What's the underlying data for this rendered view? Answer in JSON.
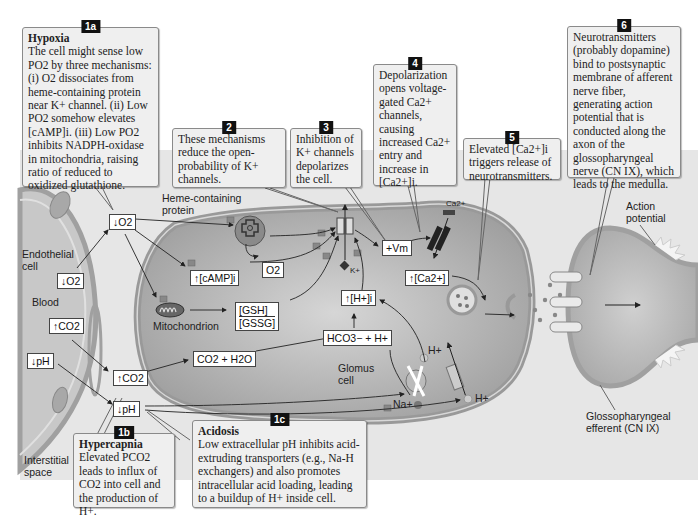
{
  "callouts": {
    "c1a": {
      "badge": "1a",
      "title": "Hypoxia",
      "text": "The cell might sense low PO2 by three mechanisms: (i) O2 dissociates from heme-containing protein near K+ channel. (ii) Low PO2 somehow elevates [cAMP]i. (iii) Low PO2 inhibits NADPH-oxidase in mitochondria, raising ratio of reduced to oxidized glutathione."
    },
    "c2": {
      "badge": "2",
      "text": "These mechanisms reduce the open-probability of K+ channels."
    },
    "c3": {
      "badge": "3",
      "text": "Inhibition of K+ channels depolarizes the cell."
    },
    "c4": {
      "badge": "4",
      "text": "Depolarization opens voltage-gated Ca2+ channels, causing increased Ca2+ entry and increase in [Ca2+]i."
    },
    "c5": {
      "badge": "5",
      "text": "Elevated [Ca2+]i triggers release of neurotransmitters."
    },
    "c6": {
      "badge": "6",
      "text": "Neurotransmitters (probably dopamine) bind to postsynaptic membrane of afferent nerve fiber, generating action potential that is conducted along the axon of the glossopharyngeal nerve (CN IX), which leads to the medulla."
    },
    "c1b": {
      "badge": "1b",
      "title": "Hypercapnia",
      "text": "Elevated PCO2 leads to influx of CO2 into cell and the production of H+."
    },
    "c1c": {
      "badge": "1c",
      "title": "Acidosis",
      "text": "Low extracellular pH inhibits acid-extruding transporters (e.g., Na-H exchangers) and also promotes intracellular acid loading, leading to a buildup of H+ inside cell."
    }
  },
  "labels": {
    "endothelial_cell": "Endothelial cell",
    "blood": "Blood",
    "interstitial_space": "Interstitial space",
    "heme_protein": "Heme-containing protein",
    "mitochondrion": "Mitochondrion",
    "glomus_cell": "Glomus cell",
    "action_potential": "Action potential",
    "glossopharyngeal": "Glossopharyngeal efferent (CN IX)",
    "k_ion": "K+",
    "ca_ion": "Ca2+",
    "h_ion_in": "H+",
    "h_ion_out": "H+",
    "na_ion": "Na+"
  },
  "boxes": {
    "o2_down_blood": "↓O2",
    "co2_up_blood": "↑CO2",
    "ph_down_blood": "↓pH",
    "o2_down": "↓O2",
    "co2_up": "↑CO2",
    "ph_down": "↓pH",
    "camp": "↑[cAMP]i",
    "gsh": "[GSH]",
    "gssg": "[GSSG]",
    "o2_released": "O2",
    "co2_h2o": "CO2 + H2O",
    "hco3_h": "HCO3− + H+",
    "h_i": "↑[H+]i",
    "vm": "+Vm",
    "ca_i": "↑[Ca2+]"
  },
  "colors": {
    "panel_bg": "#e6e6e6",
    "callout_bg": "#efefef",
    "cell_fill": "#bdbdbd",
    "membrane": "#9a9a9a",
    "badge_bg": "#111111"
  }
}
